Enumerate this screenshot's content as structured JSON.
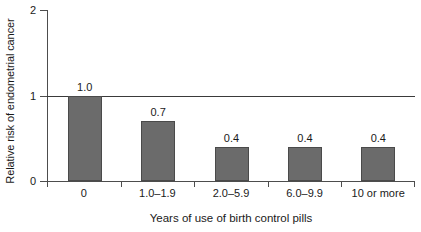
{
  "chart_data": {
    "type": "bar",
    "title": "",
    "xlabel": "Years of use of birth control pills",
    "ylabel": "Relative risk of endometrial cancer",
    "categories": [
      "0",
      "1.0–1.9",
      "2.0–5.9",
      "6.0–9.9",
      "10 or more"
    ],
    "values": [
      1.0,
      0.7,
      0.4,
      0.4,
      0.4
    ],
    "value_labels": [
      "1.0",
      "0.7",
      "0.4",
      "0.4",
      "0.4"
    ],
    "ylim": [
      0,
      2
    ],
    "ytick_labels": [
      "0",
      "1",
      "2"
    ],
    "ytick_values": [
      0,
      1,
      2
    ],
    "grid": false,
    "legend": null,
    "reference_line": {
      "value": 1,
      "color": "#3a3a3a"
    },
    "bar_color": "#6b6b6b",
    "bar_edge_color": "#4a4a4a",
    "axis_color": "#4d4d4d"
  }
}
